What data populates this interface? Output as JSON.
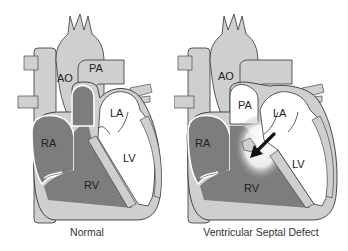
{
  "colors": {
    "light_gray": "#cfcfcf",
    "dark_gray": "#7d7d7d",
    "outline": "#333333",
    "white": "#ffffff",
    "arrow": "#111111"
  },
  "panels": [
    {
      "caption": "Normal",
      "labels": {
        "ao": "AO",
        "pa": "PA",
        "la": "LA",
        "lv": "LV",
        "ra": "RA",
        "rv": "RV"
      }
    },
    {
      "caption": "Ventricular Septal Defect",
      "labels": {
        "ao": "AO",
        "pa": "PA",
        "la": "LA",
        "lv": "LV",
        "ra": "RA",
        "rv": "RV"
      },
      "annotation": "shunt-arrow LV to RV"
    }
  ]
}
